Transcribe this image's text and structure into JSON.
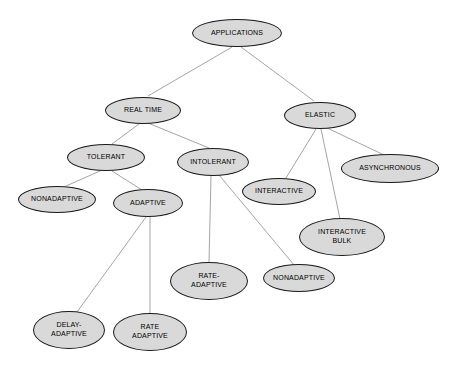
{
  "diagram": {
    "type": "tree-diagram",
    "canvas": {
      "width": 451,
      "height": 368
    },
    "style": {
      "background_color": "#ffffff",
      "node_fill_color": "#d9d9d9",
      "node_border_color": "#1a1a1a",
      "edge_color": "#9a9a9a",
      "label_color": "#000000"
    },
    "nodes": [
      {
        "id": "applications",
        "label": "APPLICATIONS",
        "cx": 237,
        "cy": 33,
        "rx": 45,
        "ry": 14
      },
      {
        "id": "real-time",
        "label": "REAL TIME",
        "cx": 143,
        "cy": 110,
        "rx": 38,
        "ry": 13.5
      },
      {
        "id": "elastic",
        "label": "ELASTIC",
        "cx": 320,
        "cy": 115,
        "rx": 36,
        "ry": 13.5
      },
      {
        "id": "tolerant",
        "label": "TOLERANT",
        "cx": 106,
        "cy": 157,
        "rx": 39,
        "ry": 13.5
      },
      {
        "id": "intolerant",
        "label": "INTOLERANT",
        "cx": 213,
        "cy": 162,
        "rx": 36,
        "ry": 14
      },
      {
        "id": "asynchronous",
        "label": "ASYNCHRONOUS",
        "cx": 390,
        "cy": 168,
        "rx": 49,
        "ry": 14.5
      },
      {
        "id": "nonadaptive-tol",
        "label": "NONADAPTIVE",
        "cx": 57,
        "cy": 199,
        "rx": 39,
        "ry": 13.5
      },
      {
        "id": "adaptive",
        "label": "ADAPTIVE",
        "cx": 148,
        "cy": 203,
        "rx": 35,
        "ry": 14
      },
      {
        "id": "interactive",
        "label": "INTERACTIVE",
        "cx": 279,
        "cy": 191,
        "rx": 37,
        "ry": 13.5
      },
      {
        "id": "interactive-bulk",
        "label": "INTERACTIVE\nBULK",
        "cx": 342,
        "cy": 237,
        "rx": 43,
        "ry": 19
      },
      {
        "id": "rate-adaptive-1",
        "label": "RATE-\nADAPTIVE",
        "cx": 209,
        "cy": 281,
        "rx": 39,
        "ry": 19
      },
      {
        "id": "nonadaptive-int",
        "label": "NONADAPTIVE",
        "cx": 299,
        "cy": 278,
        "rx": 36,
        "ry": 14
      },
      {
        "id": "delay-adaptive",
        "label": "DELAY-\nADAPTIVE",
        "cx": 69,
        "cy": 330,
        "rx": 36,
        "ry": 19
      },
      {
        "id": "rate-adaptive-2",
        "label": "RATE\nADAPTIVE",
        "cx": 150,
        "cy": 332,
        "rx": 37,
        "ry": 19
      }
    ],
    "edges": [
      {
        "from": "applications",
        "to": "real-time",
        "x1": 232,
        "y1": 47,
        "x2": 148,
        "y2": 96
      },
      {
        "from": "applications",
        "to": "elastic",
        "x1": 241,
        "y1": 47,
        "x2": 314,
        "y2": 101
      },
      {
        "from": "real-time",
        "to": "tolerant",
        "x1": 139,
        "y1": 124,
        "x2": 112,
        "y2": 144
      },
      {
        "from": "real-time",
        "to": "intolerant",
        "x1": 148,
        "y1": 123,
        "x2": 209,
        "y2": 148
      },
      {
        "from": "elastic",
        "to": "interactive",
        "x1": 316,
        "y1": 129,
        "x2": 286,
        "y2": 178
      },
      {
        "from": "elastic",
        "to": "interactive-bulk",
        "x1": 321,
        "y1": 129,
        "x2": 340,
        "y2": 219
      },
      {
        "from": "elastic",
        "to": "asynchronous",
        "x1": 325,
        "y1": 127,
        "x2": 382,
        "y2": 154
      },
      {
        "from": "tolerant",
        "to": "nonadaptive-tol",
        "x1": 100,
        "y1": 171,
        "x2": 66,
        "y2": 186
      },
      {
        "from": "tolerant",
        "to": "adaptive",
        "x1": 112,
        "y1": 171,
        "x2": 142,
        "y2": 190
      },
      {
        "from": "intolerant",
        "to": "rate-adaptive-1",
        "x1": 211,
        "y1": 176,
        "x2": 209,
        "y2": 262
      },
      {
        "from": "intolerant",
        "to": "nonadaptive-int",
        "x1": 219,
        "y1": 175,
        "x2": 294,
        "y2": 265
      },
      {
        "from": "adaptive",
        "to": "delay-adaptive",
        "x1": 146,
        "y1": 217,
        "x2": 77,
        "y2": 312
      },
      {
        "from": "adaptive",
        "to": "rate-adaptive-2",
        "x1": 150,
        "y1": 217,
        "x2": 150,
        "y2": 313
      }
    ]
  }
}
